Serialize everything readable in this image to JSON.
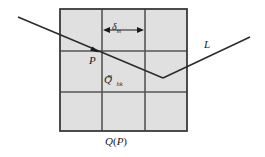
{
  "figure": {
    "labels": {
      "cell_size": "δ",
      "cell_size_sub": "m",
      "point": "P",
      "cell_name": "Q",
      "cell_name_sub": "hk",
      "cell_name_sup": "m",
      "ray": "L",
      "grid_caption": "Q",
      "grid_caption_arg": "P",
      "grid_caption_open": "(",
      "grid_caption_close": ")"
    },
    "colors": {
      "cell_fill": "#e0e0e0",
      "grid_line": "#565656",
      "outer_border": "#3a3a3a",
      "ray_line": "#2b2b2b",
      "label_text": "#1a1a1a",
      "background": "#ffffff"
    },
    "geometry": {
      "grid_left": 60,
      "grid_top": 9,
      "grid_right": 187,
      "grid_bottom": 131,
      "columns": 3,
      "rows": 3,
      "vertical_dividers": [
        102,
        145
      ],
      "horizontal_dividers": [
        51,
        92
      ],
      "ray_start": [
        18,
        17
      ],
      "ray_vertex": [
        163,
        78
      ],
      "ray_end": [
        250,
        37
      ],
      "point_p": [
        98,
        52
      ],
      "dimension_arrow_y": 30,
      "dimension_arrow_left": 103,
      "dimension_arrow_right": 144
    }
  }
}
